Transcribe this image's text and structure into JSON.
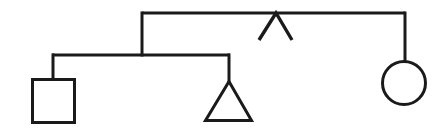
{
  "diagram": {
    "kind": "genogram",
    "canvas": {
      "width": 447,
      "height": 137
    },
    "style": {
      "background_color": "#ffffff",
      "stroke_color": "#1a1a1a",
      "stroke_width": 3
    },
    "symbols": [
      {
        "id": "male-square",
        "shape": "square",
        "meaning": "male",
        "x": 31,
        "y": 78,
        "width": 45,
        "height": 46,
        "center_x": 53,
        "center_y": 101
      },
      {
        "id": "triangle-symbol",
        "shape": "triangle",
        "meaning": "pregnancy-or-unknown-sex",
        "apex_x": 229,
        "apex_y": 80,
        "base_left_x": 204,
        "base_right_x": 253,
        "base_y": 122
      },
      {
        "id": "female-circle",
        "shape": "circle",
        "meaning": "female",
        "center_x": 404,
        "center_y": 83,
        "radius": 23
      },
      {
        "id": "caret-mark",
        "shape": "caret",
        "meaning": "inverted-v-marker",
        "apex_x": 276,
        "apex_y": 13,
        "left_x": 259,
        "left_y": 40,
        "right_x": 292,
        "right_y": 40
      }
    ],
    "connectors": [
      {
        "id": "top-sibship-line",
        "orientation": "horizontal",
        "y": 13,
        "x1": 142,
        "x2": 405
      },
      {
        "id": "top-left-descent",
        "orientation": "vertical",
        "x": 142,
        "y1": 13,
        "y2": 55
      },
      {
        "id": "top-right-descent-to-circle",
        "orientation": "vertical",
        "x": 405,
        "y1": 13,
        "y2": 60
      },
      {
        "id": "lower-sibship-line",
        "orientation": "horizontal",
        "y": 55,
        "x1": 52,
        "x2": 229
      },
      {
        "id": "descent-to-square",
        "orientation": "vertical",
        "x": 53,
        "y1": 55,
        "y2": 79
      },
      {
        "id": "descent-to-triangle",
        "orientation": "vertical",
        "x": 229,
        "y1": 55,
        "y2": 81
      }
    ]
  }
}
